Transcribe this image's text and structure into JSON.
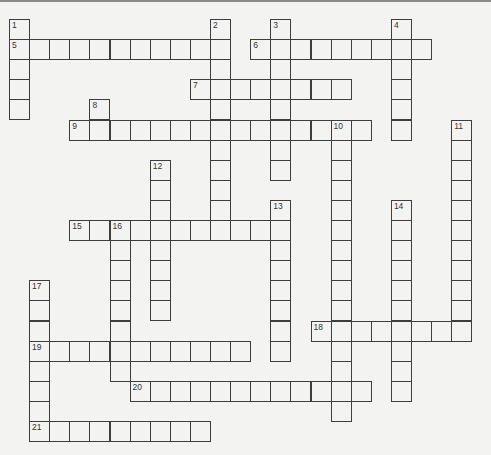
{
  "puzzle": {
    "type": "crossword",
    "cell_size": 20.1,
    "origin": [
      9,
      19
    ],
    "colors": {
      "background": "#f3f3f1",
      "grid_line": "#3e3e3e",
      "number": "#333333",
      "top_rule": "#8a8a8a"
    }
  },
  "across": [
    {
      "number": "5",
      "row": 1,
      "col": 0,
      "length": 11
    },
    {
      "number": "6",
      "row": 1,
      "col": 12,
      "length": 9
    },
    {
      "number": "7",
      "row": 3,
      "col": 9,
      "length": 8
    },
    {
      "number": "9",
      "row": 5,
      "col": 3,
      "length": 15
    },
    {
      "number": "15",
      "row": 10,
      "col": 3,
      "length": 11
    },
    {
      "number": "18",
      "row": 15,
      "col": 15,
      "length": 8
    },
    {
      "number": "19",
      "row": 16,
      "col": 1,
      "length": 11
    },
    {
      "number": "20",
      "row": 18,
      "col": 6,
      "length": 12
    },
    {
      "number": "21",
      "row": 20,
      "col": 1,
      "length": 9
    }
  ],
  "down": [
    {
      "number": "1",
      "row": 0,
      "col": 0,
      "length": 5
    },
    {
      "number": "2",
      "row": 0,
      "col": 10,
      "length": 11
    },
    {
      "number": "3",
      "row": 0,
      "col": 13,
      "length": 8
    },
    {
      "number": "4",
      "row": 0,
      "col": 19,
      "length": 6
    },
    {
      "number": "8",
      "row": 4,
      "col": 4,
      "length": 2
    },
    {
      "number": "10",
      "row": 5,
      "col": 16,
      "length": 15
    },
    {
      "number": "11",
      "row": 5,
      "col": 22,
      "length": 11
    },
    {
      "number": "12",
      "row": 7,
      "col": 7,
      "length": 8
    },
    {
      "number": "13",
      "row": 9,
      "col": 13,
      "length": 8
    },
    {
      "number": "14",
      "row": 9,
      "col": 19,
      "length": 10
    },
    {
      "number": "16",
      "row": 10,
      "col": 5,
      "length": 8
    },
    {
      "number": "17",
      "row": 13,
      "col": 1,
      "length": 8
    }
  ]
}
